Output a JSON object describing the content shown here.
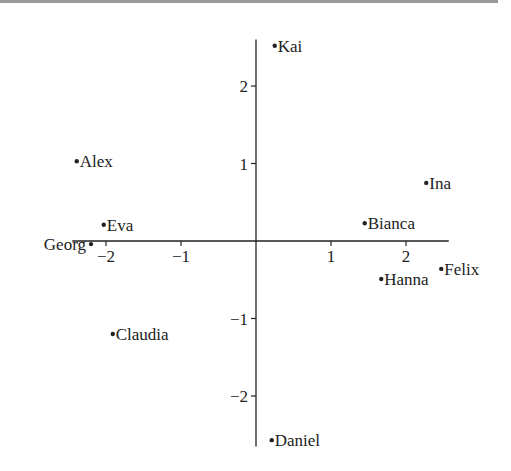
{
  "chart_data": {
    "type": "scatter",
    "title": "",
    "xlabel": "",
    "ylabel": "",
    "xlim": [
      -2.45,
      2.57
    ],
    "ylim": [
      -2.65,
      2.6
    ],
    "grid": false,
    "legend": "none",
    "x_ticks": [
      {
        "value": -2,
        "label": "−2"
      },
      {
        "value": -1,
        "label": "−1"
      },
      {
        "value": 1,
        "label": "1"
      },
      {
        "value": 2,
        "label": "2"
      }
    ],
    "y_ticks": [
      {
        "value": 2,
        "label": "2"
      },
      {
        "value": 1,
        "label": "1"
      },
      {
        "value": -1,
        "label": "−1"
      },
      {
        "value": -2,
        "label": "−2"
      }
    ],
    "points": [
      {
        "name": "Kai",
        "x": 0.25,
        "y": 2.52,
        "label_side": "right"
      },
      {
        "name": "Alex",
        "x": -2.39,
        "y": 1.03,
        "label_side": "right"
      },
      {
        "name": "Ina",
        "x": 2.27,
        "y": 0.75,
        "label_side": "right"
      },
      {
        "name": "Eva",
        "x": -2.03,
        "y": 0.21,
        "label_side": "right"
      },
      {
        "name": "Bianca",
        "x": 1.45,
        "y": 0.23,
        "label_side": "right"
      },
      {
        "name": "Georg",
        "x": -2.2,
        "y": -0.04,
        "label_side": "left"
      },
      {
        "name": "Hanna",
        "x": 1.67,
        "y": -0.49,
        "label_side": "right"
      },
      {
        "name": "Felix",
        "x": 2.47,
        "y": -0.36,
        "label_side": "right"
      },
      {
        "name": "Claudia",
        "x": -1.91,
        "y": -1.2,
        "label_side": "right"
      },
      {
        "name": "Daniel",
        "x": 0.21,
        "y": -2.57,
        "label_side": "right"
      }
    ]
  }
}
